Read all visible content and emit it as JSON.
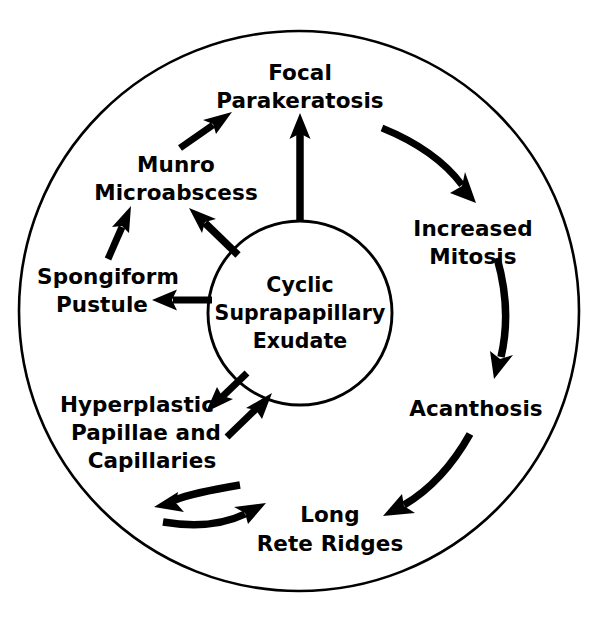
{
  "figure": {
    "kind": "cycle-diagram",
    "background_color": "#ffffff",
    "ink_color": "#000000"
  },
  "center": {
    "name": "cyclic-suprapapillary-exudate",
    "lines": [
      "Cyclic",
      "Suprapapillary",
      "Exudate"
    ],
    "line1": "Cyclic",
    "line2": "Suprapapillary",
    "line3": "Exudate",
    "cx": 300,
    "cy": 313,
    "r": 92
  },
  "outer_ring": {
    "name": "outer-boundary-circle",
    "cx": 299,
    "cy": 311,
    "r": 280
  },
  "nodes": [
    {
      "id": "focal-parakeratosis",
      "lines": [
        "Focal",
        "Parakeratosis"
      ],
      "line1": "Focal",
      "line2": "Parakeratosis",
      "x": 300,
      "y": 80,
      "position": "top"
    },
    {
      "id": "increased-mitosis",
      "lines": [
        "Increased",
        "Mitosis"
      ],
      "line1": "Increased",
      "line2": "Mitosis",
      "x": 473,
      "y": 228,
      "position": "upper-right"
    },
    {
      "id": "acanthosis",
      "lines": [
        "Acanthosis"
      ],
      "line1": "Acanthosis",
      "line2": "",
      "x": 473,
      "y": 410,
      "position": "lower-right"
    },
    {
      "id": "long-rete-ridges",
      "lines": [
        "Long",
        "Rete Ridges"
      ],
      "line1": "Long",
      "line2": "Rete Ridges",
      "x": 327,
      "y": 522,
      "position": "bottom"
    },
    {
      "id": "hyperplastic-papillae-and-capillaries",
      "lines": [
        "Hyperplastic",
        "Papillae and",
        "Capillaries"
      ],
      "line1": "Hyperplastic",
      "line2": "Papillae  and",
      "line3": "Capillaries",
      "x": 137,
      "y": 412,
      "position": "lower-left"
    },
    {
      "id": "spongiform-pustule",
      "lines": [
        "Spongiform",
        "Pustule"
      ],
      "line1": "Spongiform",
      "line2": "Pustule",
      "x": 110,
      "y": 285,
      "position": "left"
    },
    {
      "id": "munro-microabscess",
      "lines": [
        "Munro",
        "Microabscess"
      ],
      "line1": "Munro",
      "line2": "Microabscess",
      "x": 175,
      "y": 172,
      "position": "upper-left"
    }
  ],
  "arrows": [
    {
      "id": "center-to-focal-parakeratosis",
      "from": "center",
      "to": "focal-parakeratosis",
      "style": "straight-thick",
      "direction": "up"
    },
    {
      "id": "focal-parakeratosis-to-increased-mitosis",
      "from": "focal-parakeratosis",
      "to": "increased-mitosis",
      "style": "curved",
      "direction": "clockwise"
    },
    {
      "id": "increased-mitosis-to-acanthosis",
      "from": "increased-mitosis",
      "to": "acanthosis",
      "style": "curved",
      "direction": "clockwise"
    },
    {
      "id": "acanthosis-to-long-rete-ridges",
      "from": "acanthosis",
      "to": "long-rete-ridges",
      "style": "curved",
      "direction": "clockwise"
    },
    {
      "id": "long-rete-ridges-to-hyperplastic-papillae",
      "from": "long-rete-ridges",
      "to": "hyperplastic-papillae-and-capillaries",
      "style": "curved",
      "direction": "clockwise"
    },
    {
      "id": "hyperplastic-papillae-to-long-rete-ridges",
      "from": "hyperplastic-papillae-and-capillaries",
      "to": "long-rete-ridges",
      "style": "curved",
      "direction": "counter-clockwise"
    },
    {
      "id": "hyperplastic-papillae-to-center",
      "from": "hyperplastic-papillae-and-capillaries",
      "to": "center",
      "style": "straight-thick",
      "direction": "up-right"
    },
    {
      "id": "center-to-hyperplastic-papillae",
      "from": "center",
      "to": "hyperplastic-papillae-and-capillaries",
      "style": "straight-thick",
      "direction": "down-left"
    },
    {
      "id": "center-to-spongiform-pustule",
      "from": "center",
      "to": "spongiform-pustule",
      "style": "straight-thick",
      "direction": "left"
    },
    {
      "id": "spongiform-pustule-to-munro-microabscess",
      "from": "spongiform-pustule",
      "to": "munro-microabscess",
      "style": "straight-thick",
      "direction": "up-right"
    },
    {
      "id": "center-to-munro-microabscess",
      "from": "center",
      "to": "munro-microabscess",
      "style": "straight-thick",
      "direction": "up-left"
    },
    {
      "id": "munro-microabscess-to-focal-parakeratosis",
      "from": "munro-microabscess",
      "to": "focal-parakeratosis",
      "style": "straight-thick",
      "direction": "up-right"
    }
  ]
}
